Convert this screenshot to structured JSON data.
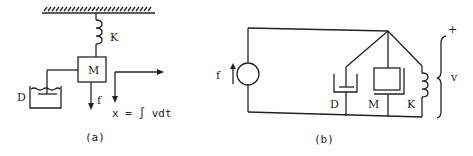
{
  "diagram_a": {
    "caption": "(a)",
    "spring_label": "K",
    "mass_label": "M",
    "damper_label": "D",
    "force_label": "f",
    "displacement_label": "x = ∫ vdt"
  },
  "diagram_b": {
    "caption": "(b)",
    "source_label": "f",
    "damper_label": "D",
    "mass_label": "M",
    "spring_label": "K",
    "voltage_label": "v",
    "plus_label": "+"
  }
}
